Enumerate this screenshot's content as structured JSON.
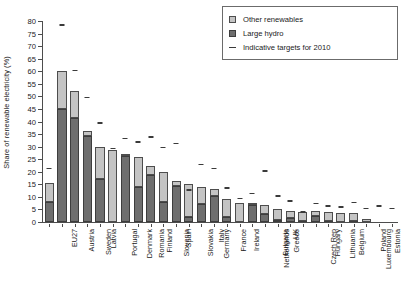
{
  "chart_data": {
    "type": "bar",
    "subtype": "stacked-bar-with-target-markers",
    "title": "",
    "xlabel": "",
    "ylabel": "Share of renewable electricity (%)",
    "ylim": [
      0,
      80
    ],
    "ytick_step": 5,
    "yticks": [
      0,
      5,
      10,
      15,
      20,
      25,
      30,
      35,
      40,
      45,
      50,
      55,
      60,
      65,
      70,
      75,
      80
    ],
    "grid": false,
    "legend_position": "top-right",
    "categories": [
      "EU27",
      "Austria",
      "Sweden",
      "Latvia",
      "Portugal",
      "Denmark",
      "Romania",
      "Finland",
      "Slovenia",
      "Spain",
      "Slovakia",
      "Germany",
      "Italy",
      "France",
      "Ireland",
      "Netherlands",
      "Bulgaria",
      "Greece",
      "UK",
      "Czech Rep",
      "Hungary",
      "Lithuania",
      "Belgium",
      "Luxembourg",
      "Poland",
      "Estonia",
      "Cyprus",
      "Malta"
    ],
    "series": [
      {
        "name": "Large hydro",
        "color": "#6e6e6e",
        "values": [
          8.0,
          45.0,
          41.5,
          34.3,
          17.0,
          0.2,
          26.4,
          14.0,
          18.8,
          7.8,
          14.5,
          2.0,
          7.2,
          10.3,
          2.0,
          0.1,
          6.8,
          3.1,
          0.8,
          1.4,
          0.5,
          2.3,
          0.3,
          0.2,
          0.5,
          0.1,
          0.0,
          0.0
        ]
      },
      {
        "name": "Other renewables",
        "color": "#c4c4c4",
        "values": [
          7.6,
          15.0,
          10.5,
          2.0,
          13.0,
          28.6,
          0.3,
          11.8,
          3.5,
          12.2,
          2.0,
          13.2,
          6.7,
          2.9,
          7.2,
          7.4,
          0.3,
          3.7,
          4.3,
          3.1,
          3.6,
          2.0,
          3.6,
          3.4,
          3.0,
          1.2,
          0.05,
          0.05
        ]
      }
    ],
    "target_series": {
      "name": "Indicative targets for 2010",
      "color": "#3a3a3a",
      "values": [
        21.0,
        78.1,
        60.0,
        49.3,
        39.0,
        29.0,
        33.0,
        31.5,
        33.6,
        29.4,
        31.0,
        12.5,
        22.5,
        21.0,
        13.2,
        9.0,
        11.0,
        20.1,
        10.0,
        8.0,
        3.6,
        7.0,
        6.0,
        5.7,
        7.5,
        5.1,
        6.0,
        5.0
      ]
    }
  },
  "legend": {
    "items": [
      {
        "label": "Other renewables",
        "swatch": "other-renewables-swatch"
      },
      {
        "label": "Large hydro",
        "swatch": "large-hydro-swatch"
      },
      {
        "label": "Indicative targets for 2010",
        "swatch": "target-dash-swatch"
      }
    ]
  },
  "axes": {
    "y_title": "Share of renewable electricity (%)"
  }
}
